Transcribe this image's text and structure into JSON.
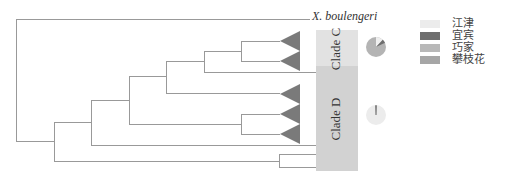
{
  "tree": {
    "outgroup_label": "X. boulengeri",
    "clades": [
      {
        "name": "Clade C",
        "color": "#e0e0e0"
      },
      {
        "name": "Clade D",
        "color": "#d0d0d0"
      }
    ]
  },
  "legend": {
    "items": [
      {
        "label": "江津",
        "color": "#ececec"
      },
      {
        "label": "宜宾",
        "color": "#6e6e6e"
      },
      {
        "label": "巧家",
        "color": "#b8b8b8"
      },
      {
        "label": "攀枝花",
        "color": "#a6a6a6"
      }
    ]
  },
  "pies": [
    {
      "clade": "Clade C",
      "slices": [
        {
          "label": "江津",
          "value": 12
        },
        {
          "label": "宜宾",
          "value": 6
        },
        {
          "label": "巧家",
          "value": 82
        }
      ]
    },
    {
      "clade": "Clade D",
      "slices": [
        {
          "label": "江津",
          "value": 98
        },
        {
          "label": "宜宾",
          "value": 2
        }
      ]
    }
  ]
}
